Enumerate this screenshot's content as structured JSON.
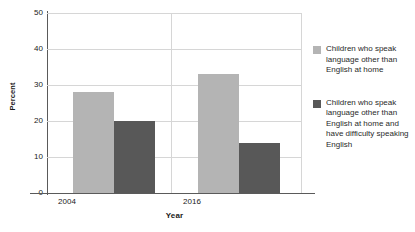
{
  "chart_data": {
    "type": "bar",
    "title": "",
    "xlabel": "Year",
    "ylabel": "Percent",
    "categories": [
      "2004",
      "2016"
    ],
    "ylim": [
      0,
      50
    ],
    "yticks": [
      50,
      40,
      30,
      20,
      10,
      0
    ],
    "grid": true,
    "legend_position": "right",
    "series": [
      {
        "name": "Children who speak language other than English at home",
        "color": "#b4b4b4",
        "values": [
          28,
          33
        ]
      },
      {
        "name": "Children who speak language other than English at home and have difficulty speaking English",
        "color": "#585858",
        "values": [
          20,
          14
        ]
      }
    ]
  },
  "axes": {
    "ylabel": "Percent",
    "xlabel": "Year",
    "ytick_0": "50",
    "ytick_1": "40",
    "ytick_2": "30",
    "ytick_3": "20",
    "ytick_4": "10",
    "ytick_5": "0",
    "xtick_0": "2004",
    "xtick_1": "2016"
  },
  "legend": {
    "items": [
      {
        "label": "Children who speak language other than English at home",
        "color": "#b4b4b4"
      },
      {
        "label": "Children who speak language other than English at home and have difficulty speaking English",
        "color": "#585858"
      }
    ]
  }
}
